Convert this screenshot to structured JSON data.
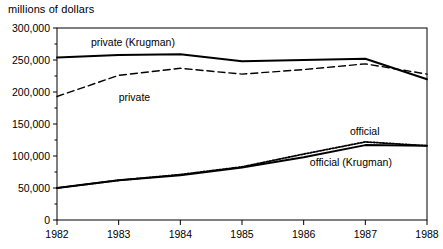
{
  "chart_data": {
    "type": "line",
    "title": "millions of dollars",
    "xlabel": "",
    "ylabel": "millions of dollars",
    "x": [
      1982,
      1983,
      1984,
      1985,
      1986,
      1987,
      1988
    ],
    "xtick_labels": [
      "1982",
      "1983",
      "1984",
      "1985",
      "1986",
      "1987",
      "1988"
    ],
    "ytick_labels": [
      "0",
      "50,000",
      "100,000",
      "150,000",
      "200,000",
      "250,000",
      "300,000"
    ],
    "ytick_values": [
      0,
      50000,
      100000,
      150000,
      200000,
      250000,
      300000
    ],
    "xlim": [
      1982,
      1988
    ],
    "ylim": [
      0,
      300000
    ],
    "grid": false,
    "legend_position": "inline-annotations",
    "series": [
      {
        "name": "private (Krugman)",
        "style": "solid",
        "color": "#000000",
        "values": [
          254000,
          258000,
          259000,
          248000,
          250000,
          252000,
          220000
        ]
      },
      {
        "name": "private",
        "style": "dashed",
        "color": "#000000",
        "values": [
          193000,
          226000,
          237000,
          228000,
          235000,
          244000,
          228000
        ]
      },
      {
        "name": "official",
        "style": "dotted",
        "color": "#000000",
        "values": [
          50000,
          62000,
          71000,
          83000,
          103000,
          122000,
          116000
        ]
      },
      {
        "name": "official (Krugman)",
        "style": "solid",
        "color": "#000000",
        "values": [
          50000,
          62000,
          70000,
          82000,
          98000,
          117000,
          116000
        ]
      }
    ],
    "annotations": [
      {
        "text": "private (Krugman)",
        "x": 1982.55,
        "y": 272000
      },
      {
        "text": "private",
        "x": 1983.0,
        "y": 186000
      },
      {
        "text": "official",
        "x": 1986.75,
        "y": 133000
      },
      {
        "text": "official (Krugman)",
        "x": 1986.1,
        "y": 84000
      }
    ]
  },
  "axis": {
    "top_title": "millions of dollars"
  }
}
